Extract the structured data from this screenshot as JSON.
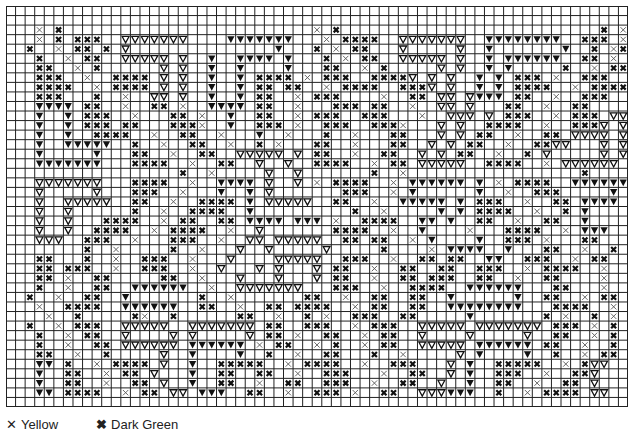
{
  "chart": {
    "columns": 65,
    "rows": 42,
    "grid_color": "#222222",
    "symbols": {
      "y": {
        "name": "Yellow",
        "glyph": "x-thin",
        "color": "#444444"
      },
      "g": {
        "name": "Dark Green",
        "glyph": "x-bold",
        "color": "#111111"
      },
      "o": {
        "name": "Open triangle",
        "glyph": "triangle-outline",
        "color": "#111111"
      },
      "f": {
        "name": "Filled triangle",
        "glyph": "triangle-filled",
        "color": "#111111"
      },
      ".": {
        "name": "Background",
        "glyph": "empty"
      }
    },
    "grid_rows": [
      ".................................................................",
      ".................................................................",
      "...y.g..........................y.g...........................g.y",
      "...y.g.ggg..ooooooo....fffffff...y.gggg..ooooooo..ffffffff..ggg.y",
      "..g..y.gg.g.o...............f...g.y.gg...o.....o..f.......f..g.yg",
      "...g..y.gg..ooooo.o..f..ffff.f...g.y.gg..ooooo.o..f.ffffff..gg.y.",
      "...gg..y.g......o.o..f..f....f...gg..y.g.....o.o..f.f.....g..y.gg",
      "...ggg..y..gggg.o.o..f..f.gggg.y.ggg..ggggo.o.o..f.f.ggg.y..ggg..",
      "...gggg..y.gggg.o.o..f..f.gg.gg..y.gggg..gggo.o..f.f.gggg..y.gggg",
      "...ggg...g..y..oo.o..f..f.gg..y.ggg....y..gg.oo.offf.gg..y..ggg..",
      "...ffff.gg..y..gg.y..ffff.gg..y...ggg.gg..y..oo.o...gg..y..gg....",
      "...f..f.ggg..y...gg.y..f..gg..y.ggg..ggg...y..ooo.o.ggg..y.ggg.oo",
      "...f..f.ggg.gg...gggy..f..ggg.y..ggg..gggy...o.o..gggg..y..gggo.o",
      "...f..f..gggg..y..gg..y...f..y...g..y...gg...o.o.gg..y..gg.oooo.o",
      "...f..fffff..g..y..gg..y..g.y...gg..y...gg..o.o.gg..y..ggoo...o.o",
      "...f.....f...gg..y..gg..ooooo.o.gg..y..gg..o.o.gg..y..g.o.....o.o",
      "...fffffff...gggg..y..gg..o..o..gggg..y.gg.ooooo..gggg..y.oooooo.",
      "..................g..y.....o..o.......g..y..................g....",
      "...ooooooo...gggg..y..ffff.o..o.y.gggg..y.ffffff.f.y.gggg..ffffff",
      "...o.....o...ggg..y...f..f.o.......ggg..y.f......f..y..ggg.....f.",
      "...o..ooooo..gg..y..gggg.f.ooooo..gg..y..fffff.f.ggg..y..gg.ffff.",
      "...o..o......g..y..gggg..f..........g..y.....f.f.gggg..y..g.f....",
      "...o..o...gggg..y.gg..gg.ffff.fff.y..gggg..ff.f..gg..y..gg..f....",
      "...o..o..gggg..y.gggg..y..o.......gggg..y..f....y...gggg..y.fff..",
      "...ooo..ggg..y...ggg..y..oo.ooooo..gg.gg..y.f....f..ggg.y...gg...",
      "........g..y.....g..y...o..o.....o.....g....y.ffff..f...gg..y..g.",
      "...gg...g..y..ggg..y...o....ooooo..ggg..y..gg.gg..ff..ggg..y.gg..",
      "...gg.ggg..y..ggg..y..o...o.o...o.gg..y..gg..gg..ggg..y.gggg..y..",
      "...gg.y..gg.....gg..y...o...o...o.gg..y..gg.ggg..gg..y..gg....y..",
      "...g..y..gg..ffffff..y..ooooooo...ggg..y..gggg..ffffff...gg...y..",
      "..g..y..gg..f.......g..y.......gg..y..gg..gg..f......f..gg..y.gg.",
      "...y..gggg..ffffff..gg..y..gg.gggg..y.gg..gg..ffffffff...gggg..y.",
      "....y..g.....gy..g......gg..y..g.y..ggg..gg.....f.......g.y..g.y.",
      "..g..y.ggg..ooooo..ooooooo.gg..ggg..y.ggg..ooooo.ooooooo.ggg.y.g.",
      "...g..y.gg..o....o.o.....o.gg.y..gg..y.gg..o....o.....o..gg..y.g.",
      "...g..y..gg.oooooo.ffffff.y.gg..y.g..y.gg..ooooo.ffffff.gg..y..g.",
      "...gg..y..g.....o..f....f..g..y..gg...g..y.....o.f....f..g..y.gg.",
      "...ff.g..y.gggg.o..f..ggggg..y.gggg..y..ggg...o.f..ggggg..y.goo..",
      "...f..gg..y.gg.o...f..gg..gg..y..ggg...y..gg..o.f..ggg..y..ggo...",
      "...f..gg..y..gg.o..f..gg..y..gg..ggg..y..gg..o..f..gg..y..gg.o...",
      "...ff.gggg..y.gg.oo.fff..gg..y..ggg.y..gg..ooofff..g..y.gggg.oo..",
      "................................................................."
    ]
  },
  "legend": {
    "items": [
      {
        "glyph": "✕",
        "label": "Yellow"
      },
      {
        "glyph": "✖",
        "label": "Dark Green"
      }
    ]
  }
}
